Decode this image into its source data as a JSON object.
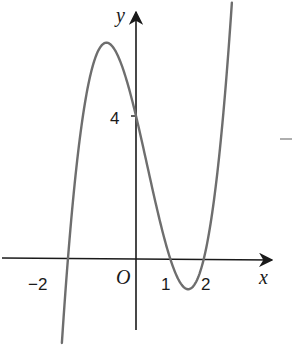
{
  "chart_data": {
    "type": "line",
    "title": "",
    "function": "f(x) = (x+2)(x-1)(x-2)",
    "xlabel": "x",
    "ylabel": "y",
    "origin_label": "O",
    "x_tick_labels": [
      "-2",
      "1",
      "2"
    ],
    "x_ticks": [
      -2,
      1,
      2
    ],
    "y_tick_labels": [
      "4"
    ],
    "y_ticks": [
      4
    ],
    "xlim": [
      -2.3,
      3.9
    ],
    "ylim": [
      -2.1,
      7.2
    ],
    "grid": false,
    "legend": null,
    "roots": [
      -2,
      1,
      2
    ],
    "y_intercept": 4,
    "local_max": {
      "x": -0.87,
      "y": 6.06
    },
    "local_min": {
      "x": 1.54,
      "y": -0.88
    },
    "series": [
      {
        "name": "f(x)",
        "x": [
          -2.18,
          -2.0,
          -1.75,
          -1.5,
          -1.25,
          -1.0,
          -0.87,
          -0.75,
          -0.5,
          -0.25,
          0.0,
          0.25,
          0.5,
          0.75,
          1.0,
          1.25,
          1.54,
          1.75,
          2.0,
          2.25,
          2.5,
          2.82
        ],
        "values": [
          -1.91,
          0.0,
          1.86,
          3.38,
          4.5,
          6.0,
          6.06,
          6.02,
          5.63,
          4.89,
          4.0,
          2.95,
          1.88,
          0.86,
          0.0,
          -0.61,
          -0.88,
          -0.7,
          0.0,
          1.11,
          2.63,
          5.6
        ]
      }
    ],
    "colors": {
      "curve": "#6e6e6e",
      "axes": "#1a1a1a"
    },
    "annotations": [
      "-"
    ]
  }
}
